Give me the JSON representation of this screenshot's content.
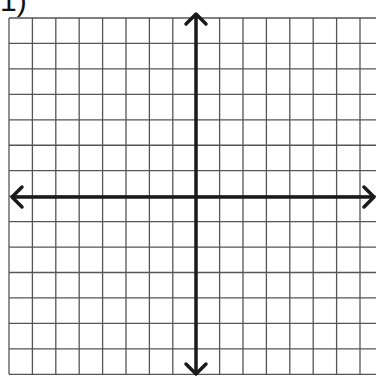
{
  "problem": {
    "number_label": "1)"
  },
  "grid": {
    "left": 9,
    "top": 18,
    "col_width": 23.4,
    "row_height": 25.45,
    "cols": 16,
    "rows": 14,
    "line_color": "#555555",
    "axis_color": "#1a1a1a"
  },
  "axes": {
    "origin": {
      "x": 196,
      "y": 197
    },
    "x_axis": {
      "from": 12,
      "to": 374,
      "arrows": "both"
    },
    "y_axis": {
      "from": 14,
      "to": 374,
      "arrows": "both"
    }
  }
}
